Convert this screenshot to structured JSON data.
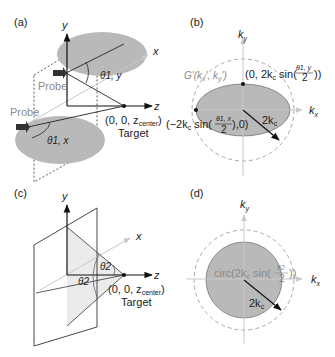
{
  "panels": {
    "a": {
      "label": "(a)",
      "axes": {
        "x": "x",
        "y": "y",
        "z": "z"
      },
      "probe_top": "Probe",
      "probe_bottom": "Probe",
      "angle_y": "θ1, y",
      "angle_x": "θ1, x",
      "target_coord": "(0, 0, z",
      "target_coord_sub": "center",
      "target_coord_close": ")",
      "target_label": "Target"
    },
    "b": {
      "label": "(b)",
      "axis_ky": "k",
      "axis_ky_sub": "y",
      "axis_kx": "k",
      "axis_kx_sub": "x",
      "function_label": "G'(k",
      "function_label_rest": "x', k",
      "function_label_end": "y')",
      "top_point": "(0, 2k",
      "top_point_rest": "c sin(",
      "top_frac_num": "θ1, y",
      "top_frac_den": "2",
      "top_close": "))",
      "left_point": "(−2k",
      "left_point_rest": "c sin(",
      "left_frac_num": "θ1, x",
      "left_frac_den": "2",
      "left_close": "),0)",
      "radius": "2k",
      "radius_sub": "c"
    },
    "c": {
      "label": "(c)",
      "axes": {
        "x": "x",
        "y": "y",
        "z": "z"
      },
      "angle_1": "θ2",
      "angle_2": "θ2",
      "target_coord": "(0, 0, z",
      "target_coord_sub": "center",
      "target_coord_close": ")",
      "target_label": "Target"
    },
    "d": {
      "label": "(d)",
      "axis_ky": "k",
      "axis_ky_sub": "y",
      "axis_kx": "k",
      "axis_kx_sub": "x",
      "circ_label": "circ(2k",
      "circ_label_rest": "c sin(",
      "circ_frac_num": "θ2",
      "circ_frac_den": "2",
      "circ_close": "))",
      "radius": "2k",
      "radius_sub": "c"
    }
  },
  "colors": {
    "fill_gray": "#b9b9b9",
    "line": "#222222",
    "dashed_gray": "#aaaaaa",
    "light_axis": "#c8c8c8"
  }
}
